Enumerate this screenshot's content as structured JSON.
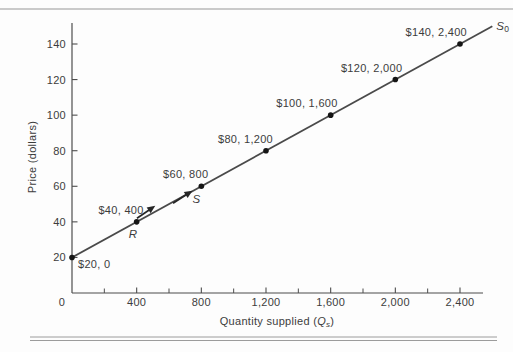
{
  "figure": {
    "background": "#fdfdfd",
    "top_rule_color": "#b9b9b9",
    "bottom_rule_color": "#9c9c9c",
    "axis_color": "#4d4d4d",
    "text_color": "#3c3c3c",
    "line_color": "#4a4a4a",
    "dot_color": "#151515",
    "arrow_color": "#262626"
  },
  "chart_data": {
    "type": "line",
    "title": "",
    "ylabel": "Price (dollars)",
    "xlabel": {
      "text": "Quantity supplied (",
      "var": "Q",
      "sub": "s",
      "close": ")"
    },
    "xlim": [
      0,
      2542
    ],
    "ylim": [
      0,
      152
    ],
    "grid": false,
    "legend": "none",
    "y_ticks": [
      {
        "value": 20,
        "label": "20"
      },
      {
        "value": 40,
        "label": "40"
      },
      {
        "value": 60,
        "label": "60"
      },
      {
        "value": 80,
        "label": "80"
      },
      {
        "value": 100,
        "label": "100"
      },
      {
        "value": 120,
        "label": "120"
      },
      {
        "value": 140,
        "label": "140"
      }
    ],
    "x_major_ticks": [
      {
        "value": 0,
        "label": "0"
      },
      {
        "value": 400,
        "label": "400"
      },
      {
        "value": 800,
        "label": "800"
      },
      {
        "value": 1200,
        "label": "1,200"
      },
      {
        "value": 1600,
        "label": "1,600"
      },
      {
        "value": 2000,
        "label": "2,000"
      },
      {
        "value": 2400,
        "label": "2,400"
      }
    ],
    "x_minor_ticks": [
      200,
      600,
      1000,
      1400,
      1800,
      2200
    ],
    "series": [
      {
        "name": "S0",
        "curve_label": {
          "main": "S",
          "sub": "0"
        },
        "points": [
          {
            "price": 20,
            "quantity": 0,
            "label": "$20, 0",
            "label_side": "below-right"
          },
          {
            "price": 40,
            "quantity": 400,
            "label": "$40, 400",
            "label_side": "above"
          },
          {
            "price": 60,
            "quantity": 800,
            "label": "$60, 800",
            "label_side": "above"
          },
          {
            "price": 80,
            "quantity": 1200,
            "label": "$80, 1,200",
            "label_side": "above"
          },
          {
            "price": 100,
            "quantity": 1600,
            "label": "$100, 1,600",
            "label_side": "above"
          },
          {
            "price": 120,
            "quantity": 2000,
            "label": "$120, 2,000",
            "label_side": "above"
          },
          {
            "price": 140,
            "quantity": 2400,
            "label": "$140, 2,400",
            "label_side": "above"
          }
        ]
      }
    ],
    "annotations": [
      {
        "text": "R",
        "style": "italic",
        "q": 377,
        "p": 31
      },
      {
        "text": "S",
        "style": "italic",
        "q": 770,
        "p": 50.5
      }
    ],
    "arrows": [
      {
        "name": "movement-arrow-r",
        "tail": {
          "q": 402,
          "p": 42
        },
        "head": {
          "q": 515,
          "p": 49
        }
      },
      {
        "name": "movement-arrow-s",
        "tail": {
          "q": 625,
          "p": 50.5
        },
        "head": {
          "q": 745,
          "p": 57.5
        }
      }
    ]
  }
}
